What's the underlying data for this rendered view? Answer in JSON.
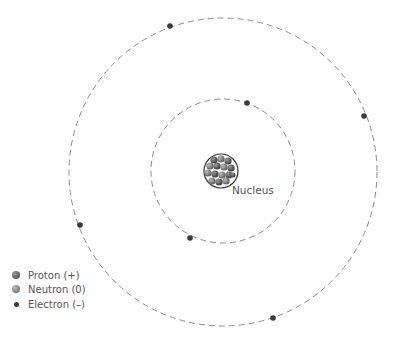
{
  "diagram": {
    "type": "bohr-atom-model",
    "nucleus": {
      "label": "Nucleus",
      "center": [
        221,
        171
      ],
      "radius": 17,
      "particle_count": 15
    },
    "shells": [
      {
        "name": "inner-shell",
        "radius": 72,
        "electron_count": 2
      },
      {
        "name": "outer-shell",
        "radius": 154,
        "electron_count": 4
      }
    ],
    "legend": {
      "items": [
        {
          "label": "Proton (+)",
          "color": "#4a4a4a"
        },
        {
          "label": "Neutron (0)",
          "color": "#7a7a7a"
        },
        {
          "label": "Electron (–)",
          "color": "#3a3a3a"
        }
      ]
    }
  },
  "colors": {
    "orbit": "#888888",
    "electron": "#3a3a3a",
    "proton": "#4a4a4a",
    "neutron": "#7a7a7a",
    "text": "#555555"
  }
}
